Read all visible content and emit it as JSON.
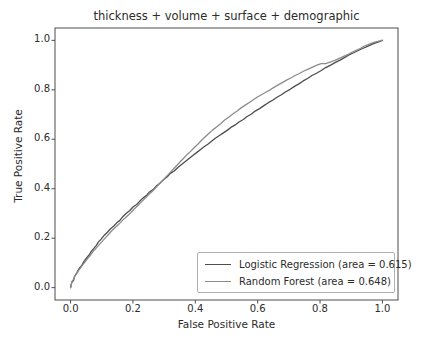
{
  "chart_data": {
    "type": "line",
    "title": "thickness + volume + surface + demographic",
    "xlabel": "False Positive Rate",
    "ylabel": "True Positive Rate",
    "xlim": [
      -0.05,
      1.05
    ],
    "ylim": [
      -0.05,
      1.05
    ],
    "grid": false,
    "legend_position": "lower right",
    "xticks": [
      "0.0",
      "0.2",
      "0.4",
      "0.6",
      "0.8",
      "1.0"
    ],
    "xtick_values": [
      0.0,
      0.2,
      0.4,
      0.6,
      0.8,
      1.0
    ],
    "yticks": [
      "0.0",
      "0.2",
      "0.4",
      "0.6",
      "0.8",
      "1.0"
    ],
    "ytick_values": [
      0.0,
      0.2,
      0.4,
      0.6,
      0.8,
      1.0
    ],
    "series": [
      {
        "name": "Logistic Regression (area = 0.615)",
        "short_name": "Logistic Regression",
        "area": 0.615,
        "color": "#4d4d4d",
        "x": [
          0.0,
          0.004,
          0.01,
          0.012,
          0.016,
          0.02,
          0.024,
          0.03,
          0.036,
          0.042,
          0.05,
          0.058,
          0.066,
          0.074,
          0.082,
          0.09,
          0.098,
          0.108,
          0.118,
          0.128,
          0.138,
          0.148,
          0.158,
          0.168,
          0.178,
          0.19,
          0.2,
          0.212,
          0.222,
          0.232,
          0.244,
          0.254,
          0.266,
          0.276,
          0.288,
          0.298,
          0.31,
          0.32,
          0.332,
          0.344,
          0.356,
          0.368,
          0.38,
          0.392,
          0.404,
          0.416,
          0.428,
          0.44,
          0.452,
          0.464,
          0.476,
          0.49,
          0.502,
          0.514,
          0.528,
          0.54,
          0.554,
          0.566,
          0.58,
          0.592,
          0.606,
          0.62,
          0.634,
          0.648,
          0.662,
          0.676,
          0.69,
          0.704,
          0.718,
          0.732,
          0.746,
          0.76,
          0.774,
          0.79,
          0.804,
          0.818,
          0.834,
          0.848,
          0.864,
          0.878,
          0.894,
          0.908,
          0.924,
          0.938,
          0.952,
          0.966,
          0.978,
          0.988,
          0.996,
          1.0
        ],
        "y": [
          0.0,
          0.022,
          0.03,
          0.044,
          0.052,
          0.06,
          0.07,
          0.082,
          0.09,
          0.104,
          0.118,
          0.13,
          0.146,
          0.158,
          0.17,
          0.186,
          0.196,
          0.212,
          0.224,
          0.238,
          0.248,
          0.262,
          0.272,
          0.288,
          0.3,
          0.312,
          0.326,
          0.336,
          0.35,
          0.362,
          0.374,
          0.388,
          0.398,
          0.412,
          0.424,
          0.436,
          0.448,
          0.462,
          0.472,
          0.486,
          0.498,
          0.51,
          0.522,
          0.534,
          0.546,
          0.558,
          0.57,
          0.58,
          0.592,
          0.604,
          0.614,
          0.626,
          0.636,
          0.648,
          0.658,
          0.67,
          0.68,
          0.692,
          0.702,
          0.714,
          0.724,
          0.736,
          0.748,
          0.758,
          0.77,
          0.78,
          0.792,
          0.802,
          0.814,
          0.824,
          0.836,
          0.846,
          0.858,
          0.868,
          0.878,
          0.89,
          0.9,
          0.91,
          0.92,
          0.93,
          0.942,
          0.95,
          0.96,
          0.968,
          0.976,
          0.984,
          0.99,
          0.994,
          0.998,
          1.0
        ]
      },
      {
        "name": "Random Forest (area = 0.648)",
        "short_name": "Random Forest",
        "area": 0.648,
        "color": "#8c8c8c",
        "x": [
          0.0,
          0.004,
          0.01,
          0.014,
          0.02,
          0.026,
          0.032,
          0.04,
          0.048,
          0.056,
          0.064,
          0.072,
          0.082,
          0.092,
          0.102,
          0.112,
          0.122,
          0.132,
          0.144,
          0.156,
          0.168,
          0.18,
          0.192,
          0.204,
          0.216,
          0.228,
          0.24,
          0.252,
          0.264,
          0.276,
          0.288,
          0.3,
          0.312,
          0.324,
          0.336,
          0.348,
          0.36,
          0.372,
          0.384,
          0.396,
          0.408,
          0.42,
          0.432,
          0.444,
          0.456,
          0.47,
          0.482,
          0.494,
          0.508,
          0.52,
          0.534,
          0.546,
          0.56,
          0.572,
          0.586,
          0.598,
          0.612,
          0.626,
          0.64,
          0.652,
          0.666,
          0.68,
          0.694,
          0.706,
          0.72,
          0.734,
          0.748,
          0.762,
          0.776,
          0.79,
          0.804,
          0.818,
          0.832,
          0.846,
          0.86,
          0.874,
          0.888,
          0.902,
          0.916,
          0.93,
          0.944,
          0.956,
          0.968,
          0.978,
          0.986,
          0.992,
          0.996,
          1.0
        ],
        "y": [
          0.0,
          0.024,
          0.034,
          0.048,
          0.058,
          0.07,
          0.08,
          0.094,
          0.106,
          0.12,
          0.132,
          0.146,
          0.16,
          0.174,
          0.188,
          0.202,
          0.216,
          0.23,
          0.244,
          0.258,
          0.274,
          0.288,
          0.302,
          0.318,
          0.332,
          0.348,
          0.362,
          0.378,
          0.392,
          0.408,
          0.424,
          0.44,
          0.456,
          0.472,
          0.488,
          0.504,
          0.52,
          0.536,
          0.55,
          0.566,
          0.58,
          0.596,
          0.61,
          0.624,
          0.638,
          0.652,
          0.664,
          0.678,
          0.69,
          0.702,
          0.714,
          0.726,
          0.738,
          0.748,
          0.76,
          0.77,
          0.78,
          0.79,
          0.8,
          0.81,
          0.82,
          0.83,
          0.84,
          0.848,
          0.858,
          0.866,
          0.876,
          0.884,
          0.892,
          0.9,
          0.906,
          0.906,
          0.912,
          0.918,
          0.926,
          0.934,
          0.942,
          0.952,
          0.96,
          0.968,
          0.978,
          0.984,
          0.99,
          0.994,
          0.996,
          0.998,
          1.0,
          1.0
        ]
      }
    ]
  },
  "legend": {
    "items": [
      {
        "label": "Logistic Regression (area = 0.615)",
        "color": "#4d4d4d"
      },
      {
        "label": "Random Forest (area = 0.648)",
        "color": "#8c8c8c"
      }
    ]
  },
  "axes": {
    "spine_color": "#4d4d4d",
    "tick_color": "#4d4d4d"
  }
}
